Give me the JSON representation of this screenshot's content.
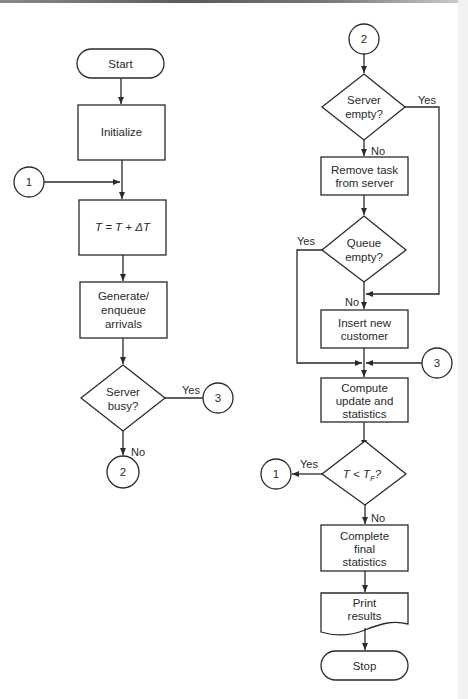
{
  "diagram": {
    "type": "flowchart",
    "left_column": {
      "start": "Start",
      "initialize": "Initialize",
      "connector_in": "1",
      "time_step": "T = T + ΔT",
      "generate": [
        "Generate/",
        "enqueue",
        "arrivals"
      ],
      "decision_server_busy": [
        "Server",
        "busy?"
      ],
      "yes_label": "Yes",
      "yes_connector": "3",
      "no_label": "No",
      "no_connector": "2"
    },
    "right_column": {
      "connector_in": "2",
      "decision_server_empty": [
        "Server",
        "empty?"
      ],
      "server_empty_yes": "Yes",
      "server_empty_no": "No",
      "remove_task": [
        "Remove task",
        "from server"
      ],
      "decision_queue_empty": [
        "Queue",
        "empty?"
      ],
      "queue_empty_yes": "Yes",
      "queue_empty_no": "No",
      "insert_customer": [
        "Insert new",
        "customer"
      ],
      "connector_merge": "3",
      "compute": [
        "Compute",
        "update and",
        "statistics"
      ],
      "decision_time": "T < T",
      "decision_time_sub": "F",
      "decision_time_q": "?",
      "time_yes": "Yes",
      "time_yes_connector": "1",
      "time_no": "No",
      "complete": [
        "Complete",
        "final",
        "statistics"
      ],
      "print": [
        "Print",
        "results"
      ],
      "stop": "Stop"
    }
  }
}
